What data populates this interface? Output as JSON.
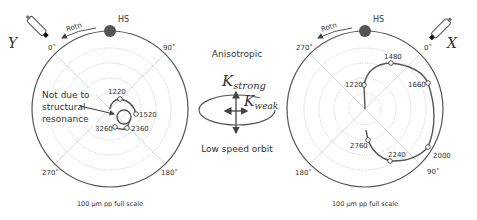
{
  "left_plot": {
    "sensor_label": "Y",
    "rotation_label": "Rotn",
    "hs_label": "HS",
    "angles": {
      "top": "0˚",
      "right": "90˚",
      "bottom_right": "180˚",
      "bottom_left": "270˚"
    },
    "annotation": [
      "Not due to",
      "structural",
      "resonance"
    ],
    "points": [
      {
        "label": "1220",
        "x": 120,
        "y": 99
      },
      {
        "label": "1520",
        "x": 136,
        "y": 114
      },
      {
        "label": "2360",
        "x": 127,
        "y": 128
      },
      {
        "label": "3260",
        "x": 115,
        "y": 127
      }
    ],
    "scale_label": "100 µm pp full scale"
  },
  "center_diagram": {
    "title": "Anisotropic",
    "k_strong": "K",
    "k_strong_sub": "strong",
    "k_weak": "K",
    "k_weak_sub": "weak",
    "caption": "Low speed orbit"
  },
  "right_plot": {
    "sensor_label": "X",
    "rotation_label": "Rotn",
    "hs_label": "HS",
    "angles": {
      "top_right": "0˚",
      "top_left": "270˚",
      "bottom_left": "180˚",
      "bottom_right": "90˚"
    },
    "points": [
      {
        "label": "1220",
        "x": 364,
        "y": 85
      },
      {
        "label": "1480",
        "x": 391,
        "y": 63
      },
      {
        "label": "1660",
        "x": 428,
        "y": 83
      },
      {
        "label": "2000",
        "x": 428,
        "y": 147
      },
      {
        "label": "2240",
        "x": 390,
        "y": 161
      },
      {
        "label": "2760",
        "x": 368,
        "y": 140
      }
    ],
    "scale_label": "100 µm pp full scale"
  }
}
